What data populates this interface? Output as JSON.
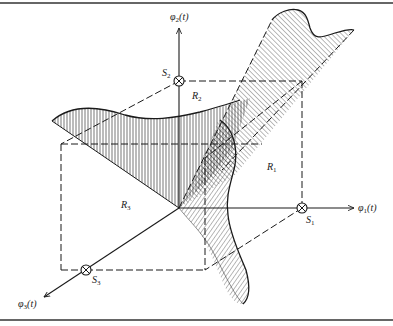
{
  "figure": {
    "type": "3d-signal-space-diagram",
    "colors": {
      "ink": "#1a1a1a",
      "background": "#ffffff"
    },
    "axes": [
      {
        "id": "phi1",
        "symbol": "φ",
        "index": "1",
        "arg": "(t)"
      },
      {
        "id": "phi2",
        "symbol": "φ",
        "index": "2",
        "arg": "(t)"
      },
      {
        "id": "phi3",
        "symbol": "φ",
        "index": "3",
        "arg": "(t)"
      }
    ],
    "signal_points": [
      {
        "id": "S1",
        "symbol": "S",
        "index": "1",
        "marker": "circle-cross"
      },
      {
        "id": "S2",
        "symbol": "S",
        "index": "2",
        "marker": "circle-cross"
      },
      {
        "id": "S3",
        "symbol": "S",
        "index": "3",
        "marker": "circle-cross"
      }
    ],
    "regions": [
      {
        "id": "R1",
        "symbol": "R",
        "index": "1",
        "hatch": "diagonal"
      },
      {
        "id": "R2",
        "symbol": "R",
        "index": "2",
        "hatch": "vertical"
      },
      {
        "id": "R3",
        "symbol": "R",
        "index": "3",
        "hatch": "horizontal"
      }
    ]
  }
}
